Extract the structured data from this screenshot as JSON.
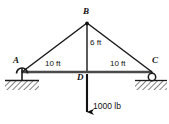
{
  "figure": {
    "type": "statics-truss-free-body-diagram",
    "width": 169,
    "height": 124,
    "background_color": "#ffffff",
    "line_color": "#1a1a1a",
    "text_color": "#111111"
  },
  "nodes": [
    {
      "id": "A",
      "label": "A",
      "x": 22,
      "y": 72,
      "label_x": 15,
      "label_y": 57,
      "support": "pin"
    },
    {
      "id": "B",
      "label": "B",
      "x": 87,
      "y": 23,
      "label_x": 83,
      "label_y": 8,
      "support": "none"
    },
    {
      "id": "C",
      "label": "C",
      "x": 152,
      "y": 72,
      "label_x": 153,
      "label_y": 57,
      "support": "roller"
    },
    {
      "id": "D",
      "label": "D",
      "x": 87,
      "y": 72,
      "label_x": 78,
      "label_y": 74,
      "support": "none"
    }
  ],
  "members": [
    {
      "id": "AB",
      "from": "A",
      "to": "B"
    },
    {
      "id": "BC",
      "from": "B",
      "to": "C"
    },
    {
      "id": "AC",
      "from": "A",
      "to": "C"
    },
    {
      "id": "BD",
      "from": "B",
      "to": "D"
    }
  ],
  "dimensions": [
    {
      "id": "AD",
      "text": "10 ft",
      "x": 54,
      "y": 62,
      "between": "A-D",
      "orientation": "horizontal"
    },
    {
      "id": "DC",
      "text": "10 ft",
      "x": 118,
      "y": 62,
      "between": "D-C",
      "orientation": "horizontal"
    },
    {
      "id": "BD",
      "text": "6 ft",
      "x": 91,
      "y": 43,
      "between": "B-D",
      "orientation": "vertical"
    }
  ],
  "load": {
    "id": "P",
    "text": "1000 lb",
    "magnitude": 1000,
    "units": "lb",
    "direction": "down",
    "applied_at": "D",
    "arrow_x": 87,
    "arrow_y_start": 74,
    "arrow_y_end": 114,
    "label_x": 94,
    "label_y": 105
  },
  "supports": {
    "pin": {
      "node": "A",
      "ground_x": 5,
      "ground_y": 80,
      "ground_width": 34,
      "hatch": true
    },
    "roller": {
      "node": "C",
      "ground_x": 135,
      "ground_y": 80,
      "ground_width": 32,
      "hatch": true,
      "radius": 4
    }
  }
}
